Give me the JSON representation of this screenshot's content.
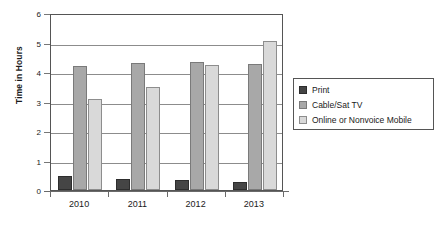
{
  "chart_data": {
    "type": "bar",
    "title": "",
    "subtitle": "",
    "xlabel": "",
    "ylabel": "Time in Hours",
    "categories": [
      "2010",
      "2011",
      "2012",
      "2013"
    ],
    "ylim": [
      0,
      6
    ],
    "yticks": [
      "0",
      "1",
      "2",
      "3",
      "4",
      "5",
      "6"
    ],
    "grid": true,
    "legend_position": "right",
    "series": [
      {
        "name": "Print",
        "color": "#454545",
        "values": [
          0.47,
          0.38,
          0.33,
          0.26
        ]
      },
      {
        "name": "Cable/Sat TV",
        "color": "#a8a8a8",
        "values": [
          4.22,
          4.3,
          4.35,
          4.28
        ]
      },
      {
        "name": "Online or Nonvoice Mobile",
        "color": "#d9d9d9",
        "values": [
          3.1,
          3.48,
          4.25,
          5.05
        ]
      }
    ]
  }
}
